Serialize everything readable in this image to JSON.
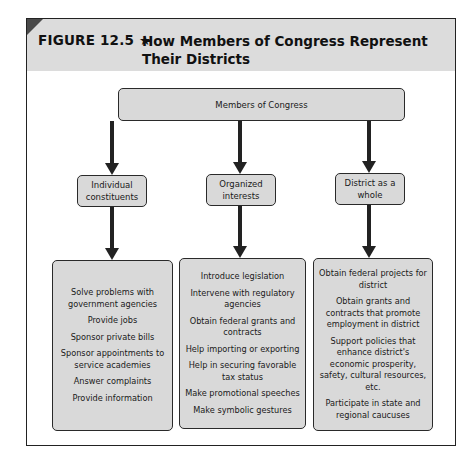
{
  "figure": {
    "label": "FIGURE 12.5 ★",
    "title": "How Members of Congress Represent Their Districts"
  },
  "diagram": {
    "root": "Members of Congress",
    "branches": [
      {
        "label": "Individual constituents",
        "items": [
          "Solve problems with government agencies",
          "Provide jobs",
          "Sponsor private bills",
          "Sponsor appointments to service academies",
          "Answer complaints",
          "Provide information"
        ]
      },
      {
        "label": "Organized interests",
        "items": [
          "Introduce legislation",
          "Intervene with regulatory agencies",
          "Obtain federal grants and contracts",
          "Help importing or exporting",
          "Help in securing favorable tax status",
          "Make promotional speeches",
          "Make symbolic gestures"
        ]
      },
      {
        "label": "District as a whole",
        "items": [
          "Obtain federal projects for district",
          "Obtain grants and contracts that promote employment in district",
          "Support policies that enhance district's economic prosperity, safety, cultural resources, etc.",
          "Participate in state and regional caucuses"
        ]
      }
    ]
  },
  "colors": {
    "header_bg": "#dcdcdc",
    "box_fill": "#d9d9d9",
    "stroke": "#222222",
    "corner": "#4a4a4a"
  }
}
